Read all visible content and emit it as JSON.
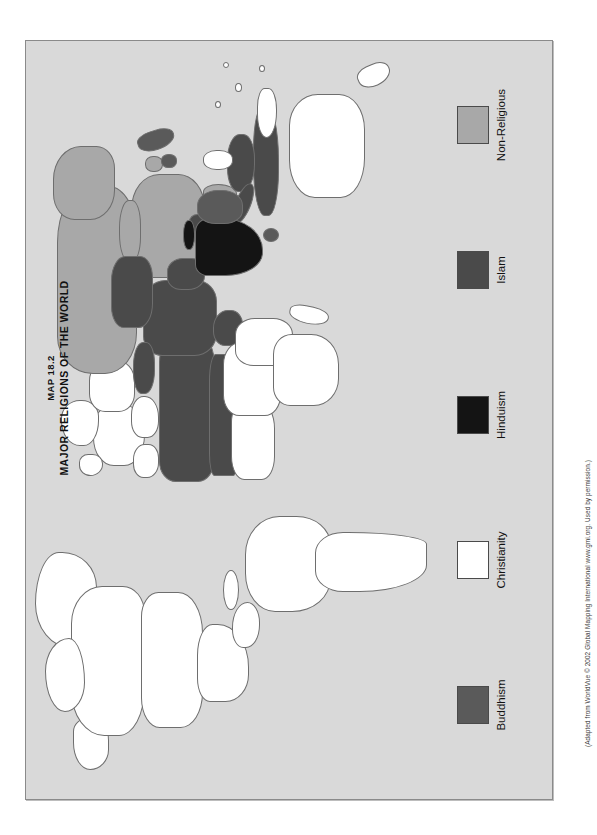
{
  "figure": {
    "map_number": "MAP 18.2",
    "map_title": "MAJOR RELIGIONS OF THE WORLD",
    "attribution": "(Adapted from WorldVue © 2002 Global Mapping International www.gmi.org. Used by permission.)",
    "orientation_note": "map rotated 90 degrees on the page",
    "ocean_color": "#d9d9d9",
    "border_color": "#6e6e6e"
  },
  "legend": {
    "items": [
      {
        "label": "Buddhism",
        "color": "#5a5a5a"
      },
      {
        "label": "Christianity",
        "color": "#ffffff"
      },
      {
        "label": "Hinduism",
        "color": "#141414"
      },
      {
        "label": "Islam",
        "color": "#4a4a4a"
      },
      {
        "label": "Non-Religious",
        "color": "#a8a8a8"
      }
    ]
  },
  "map_regions": {
    "christianity": "Americas, Europe, Sub-Saharan Africa, Australia, New Zealand, Philippines",
    "islam": "North Africa, Middle East, Central Asia, Pakistan, Bangladesh, Indonesia, Malaysia",
    "hinduism": "India, Nepal",
    "buddhism": "Southeast Asia, Mongolia, Japan, Korea, Sri Lanka, Bhutan",
    "non_religious": "China, Russia, North Korea, Vietnam"
  }
}
